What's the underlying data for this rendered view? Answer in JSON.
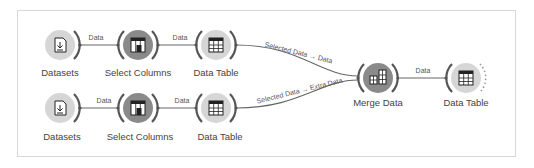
{
  "workflow": {
    "nodes": [
      {
        "id": "datasets1",
        "label": "Datasets",
        "icon": "file-download-icon"
      },
      {
        "id": "select1",
        "label": "Select Columns",
        "icon": "select-columns-icon"
      },
      {
        "id": "table1",
        "label": "Data Table",
        "icon": "table-icon"
      },
      {
        "id": "datasets2",
        "label": "Datasets",
        "icon": "file-download-icon"
      },
      {
        "id": "select2",
        "label": "Select Columns",
        "icon": "select-columns-icon"
      },
      {
        "id": "table2",
        "label": "Data Table",
        "icon": "table-icon"
      },
      {
        "id": "merge",
        "label": "Merge Data",
        "icon": "merge-icon"
      },
      {
        "id": "table3",
        "label": "Data Table",
        "icon": "table-icon"
      }
    ],
    "links": [
      {
        "from": "datasets1",
        "to": "select1",
        "label": "Data"
      },
      {
        "from": "select1",
        "to": "table1",
        "label": "Data"
      },
      {
        "from": "table1",
        "to": "merge",
        "label": "Selected Data → Data"
      },
      {
        "from": "datasets2",
        "to": "select2",
        "label": "Data"
      },
      {
        "from": "select2",
        "to": "table2",
        "label": "Data"
      },
      {
        "from": "table2",
        "to": "merge",
        "label": "Selected Data → Extra Data"
      },
      {
        "from": "merge",
        "to": "table3",
        "label": "Data"
      }
    ]
  },
  "colors": {
    "node_light": "#d6d6d6",
    "node_dark": "#8a8a8a",
    "arc": "#555555",
    "link": "#666666",
    "frame": "#d8d8d8"
  }
}
